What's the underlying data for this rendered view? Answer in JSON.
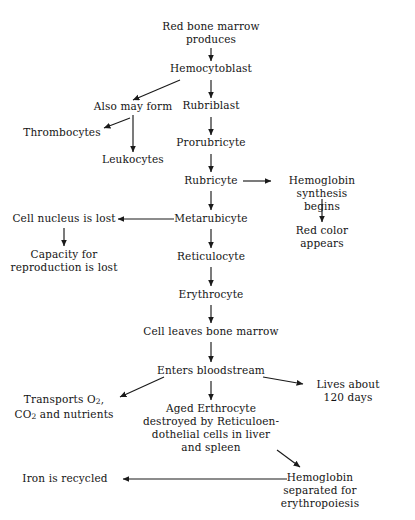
{
  "diagram": {
    "background": "#ffffff",
    "line_color": "#1a1a1a",
    "nodes": {
      "red_bone_marrow": "Red bone marrow\nproduces",
      "hemocytoblast": "Hemocytoblast",
      "also_may_form": "Also may form",
      "thrombocytes": "Thrombocytes",
      "leukocytes": "Leukocytes",
      "rubriblast": "Rubriblast",
      "prorubricyte": "Prorubricyte",
      "rubricyte": "Rubricyte",
      "hemoglobin_synthesis": "Hemoglobin synthesis\nbegins",
      "red_color_appears": "Red color appears",
      "metarubicyte": "Metarubicyte",
      "cell_nucleus_lost": "Cell nucleus is lost",
      "capacity_reproduction_lost": "Capacity for\nreproduction is lost",
      "reticulocyte": "Reticulocyte",
      "erythrocyte": "Erythrocyte",
      "cell_leaves_bone_marrow": "Cell leaves bone marrow",
      "enters_bloodstream": "Enters bloodstream",
      "transports_line1": "Transports O",
      "transports_sub1": "2",
      "transports_line1_end": ",",
      "transports_line2_start": "CO",
      "transports_sub2": "2",
      "transports_line2_end": " and nutrients",
      "lives_about": "Lives about\n120 days",
      "aged_erythrocyte": "Aged Erthrocyte\ndestroyed by Reticuloen-\ndothelial cells in liver\nand spleen",
      "hemoglobin_separated": "Hemoglobin separated for\nerythropoiesis",
      "iron_recycled": "Iron is recycled"
    }
  }
}
